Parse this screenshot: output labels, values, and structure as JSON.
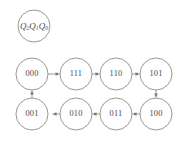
{
  "diagram": {
    "type": "state-transition-diagram",
    "legend": {
      "name": "state-register-label",
      "text": "Q2Q1Q0",
      "base": "Q",
      "subscripts": [
        "2",
        "1",
        "0"
      ],
      "cx": 34,
      "cy": 26,
      "r": 16
    },
    "colors": {
      "stroke": "#8d8d8d",
      "text": "#4a4a4a",
      "arrow": "#7a7a7a",
      "background": "#ffffff"
    },
    "node_radius": 16,
    "nodes": [
      {
        "id": "n000",
        "label": "000",
        "cx": 32,
        "cy": 74
      },
      {
        "id": "n111",
        "label": "111",
        "cx": 76,
        "cy": 74
      },
      {
        "id": "n110",
        "label": "110",
        "cx": 116,
        "cy": 74
      },
      {
        "id": "n101",
        "label": "101",
        "cx": 156,
        "cy": 74
      },
      {
        "id": "n100",
        "label": "100",
        "cx": 156,
        "cy": 114
      },
      {
        "id": "n011",
        "label": "011",
        "cx": 116,
        "cy": 114
      },
      {
        "id": "n010",
        "label": "010",
        "cx": 76,
        "cy": 114
      },
      {
        "id": "n001",
        "label": "001",
        "cx": 32,
        "cy": 114
      }
    ],
    "edges": [
      {
        "id": "e1",
        "from": "000",
        "to": "111",
        "direction": "right"
      },
      {
        "id": "e2",
        "from": "111",
        "to": "110",
        "direction": "right"
      },
      {
        "id": "e3",
        "from": "110",
        "to": "101",
        "direction": "right"
      },
      {
        "id": "e4",
        "from": "101",
        "to": "100",
        "direction": "down"
      },
      {
        "id": "e5",
        "from": "100",
        "to": "011",
        "direction": "left"
      },
      {
        "id": "e6",
        "from": "011",
        "to": "010",
        "direction": "left"
      },
      {
        "id": "e7",
        "from": "010",
        "to": "001",
        "direction": "left"
      },
      {
        "id": "e8",
        "from": "001",
        "to": "000",
        "direction": "up"
      }
    ]
  }
}
